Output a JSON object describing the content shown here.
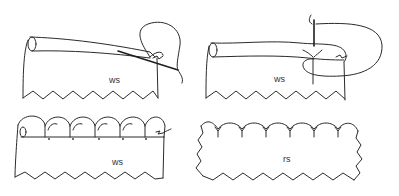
{
  "figure": {
    "panels": [
      {
        "id": "panel-1",
        "label": "ws",
        "side": "wrong side",
        "step": "needle inserted under rolled hem, thread looped"
      },
      {
        "id": "panel-2",
        "label": "ws",
        "side": "wrong side",
        "step": "needle pierces through roll, thread wrapped around"
      },
      {
        "id": "panel-3",
        "label": "ws",
        "side": "wrong side",
        "step": "completed shell stitches along rolled edge"
      },
      {
        "id": "panel-4",
        "label": "rs",
        "side": "right side",
        "step": "finished scalloped shell edge"
      }
    ],
    "ink_color": "#2a2a2a",
    "background": "#ffffff"
  }
}
